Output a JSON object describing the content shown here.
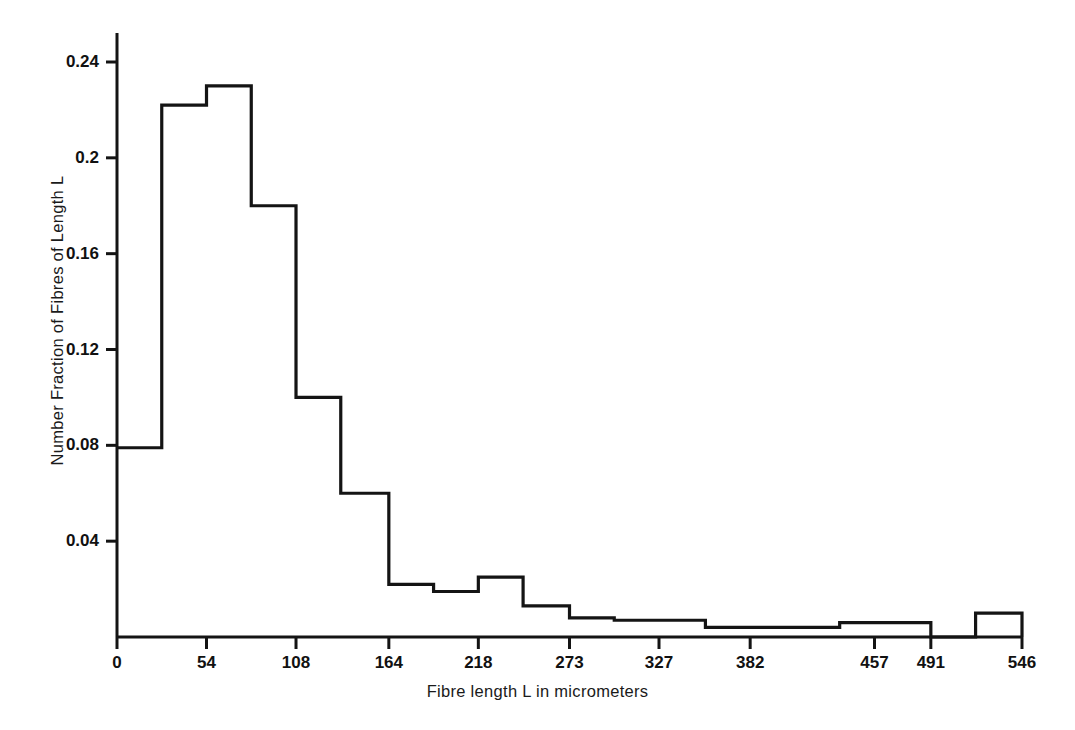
{
  "chart_data": {
    "type": "bar",
    "title": "",
    "xlabel": "Fibre length L in micrometers",
    "ylabel": "Number Fraction of Fibres of Length L",
    "grid": false,
    "legend": false,
    "xlim": [
      0,
      546
    ],
    "ylim": [
      0,
      0.258
    ],
    "xticks": [
      0,
      54,
      108,
      164,
      218,
      273,
      327,
      382,
      457,
      491,
      546
    ],
    "xtick_labels": [
      "0",
      "54",
      "108",
      "164",
      "218",
      "273",
      "327",
      "382",
      "457",
      "491",
      "546"
    ],
    "yticks": [
      0.04,
      0.08,
      0.12,
      0.16,
      0.2,
      0.24
    ],
    "ytick_labels": [
      "0.04",
      "0.08",
      "0.12",
      "0.16",
      "0.2",
      "0.24"
    ],
    "bin_edges": [
      0,
      27,
      54,
      81,
      108,
      135,
      164,
      191,
      218,
      245,
      273,
      300,
      327,
      355,
      382,
      409,
      436,
      464,
      491,
      518,
      546
    ],
    "values": [
      0.079,
      0.222,
      0.23,
      0.18,
      0.1,
      0.06,
      0.022,
      0.019,
      0.025,
      0.013,
      0.008,
      0.007,
      0.007,
      0.004,
      0.004,
      0.004,
      0.006,
      0.006,
      0.0,
      0.01
    ],
    "bar_style": "step-outline",
    "line_color": "#141414",
    "fill_color": "none"
  },
  "figure": {
    "background": "#ffffff",
    "axis_color": "#141414"
  }
}
